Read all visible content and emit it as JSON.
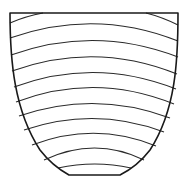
{
  "figure": {
    "title": "Shield-shaped vessel outline with curved horizontal bands",
    "stroke_color": "#1a1a1a",
    "band_color": "#2a2a2a",
    "background": "#ffffff",
    "outline_path": "M10,13 L178,13 C178,60 176,110 150,150 C140,163 130,170 120,175 L69,175 C60,170 50,163 40,150 C14,110 10,60 10,13 Z",
    "bands": [
      {
        "id": 1,
        "d": "M10,23 Q26,16 43,13"
      },
      {
        "id": 2,
        "d": "M146,13 Q162,17 178,25"
      },
      {
        "id": 3,
        "d": "M10,38 Q95,8 178,41"
      },
      {
        "id": 4,
        "d": "M11,55 Q95,25 178,57"
      },
      {
        "id": 5,
        "d": "M12,71 Q95,41 177,74"
      },
      {
        "id": 6,
        "d": "M14,87 Q95,57 176,89"
      },
      {
        "id": 7,
        "d": "M16,102 Q95,72 174,104"
      },
      {
        "id": 8,
        "d": "M19,116 Q95,90 170,118"
      },
      {
        "id": 9,
        "d": "M24,130 Q95,106 164,132"
      },
      {
        "id": 10,
        "d": "M32,145 Q95,121 156,146"
      },
      {
        "id": 11,
        "d": "M44,160 Q95,136 144,160"
      },
      {
        "id": 12,
        "d": "M58,168 Q95,160 131,168"
      }
    ],
    "band_count": 12
  }
}
